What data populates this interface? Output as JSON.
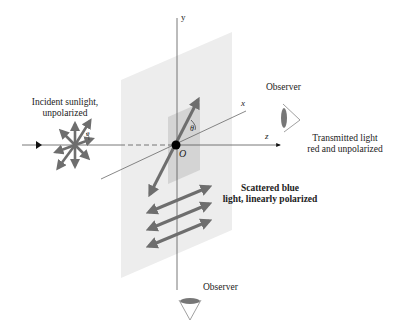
{
  "diagram": {
    "axes": {
      "x": "x",
      "y": "y",
      "z": "z",
      "origin": "O"
    },
    "angle_label": "θ",
    "angle_label_source": "θ",
    "labels": {
      "incident_line1": "Incident sunlight,",
      "incident_line2": "unpolarized",
      "observer_right": "Observer",
      "transmitted_line1": "Transmitted light",
      "transmitted_line2": "red and unpolarized",
      "scattered_line1": "Scattered blue",
      "scattered_line2": "light, linearly polarized",
      "observer_bottom": "Observer"
    },
    "colors": {
      "plane": "#ececec",
      "inner_plane": "#c8c8c8",
      "arrow": "#6e6e6e",
      "axis": "#555555",
      "origin": "#000000"
    }
  }
}
